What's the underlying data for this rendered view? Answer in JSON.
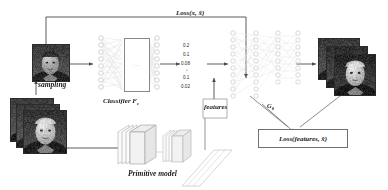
{
  "figure": {
    "type": "diagram"
  },
  "labels": {
    "loss_top": "Loss(x, x̂)",
    "loss_features": "Loss(features, x̂)",
    "sampling": "sampling",
    "classifier": "Classifier F",
    "classifier_sub": "c",
    "features": "features",
    "generator": "G",
    "generator_sub": "θ",
    "primitive_model": "Primitive model",
    "classifier_box_glyph": "···"
  },
  "probabilities": [
    "0.2",
    "0.1",
    "0.08",
    "0.1",
    "0.02"
  ],
  "colors": {
    "line": "#4a4a4a",
    "faint_line": "#d4d4d4",
    "node_stroke": "#c8c8c8",
    "box_stroke": "#6f6f6f",
    "text": "#1a1a1a",
    "photo_frame": "#2b2b2b"
  },
  "nodes": {
    "classifier_input_count": 8,
    "classifier_output_count": 8,
    "decoder_layer_counts": [
      10,
      10,
      8,
      8
    ]
  }
}
